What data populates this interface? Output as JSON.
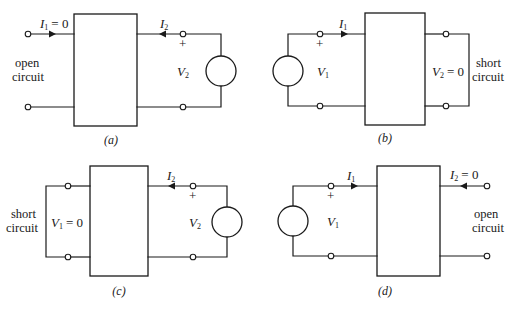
{
  "figure": {
    "panels": [
      {
        "id": "a",
        "caption": "(a)",
        "port1": {
          "current_label": "I",
          "current_sub": "1",
          "current_value": "= 0",
          "note_line1": "open",
          "note_line2": "circuit",
          "condition": "open circuit"
        },
        "port2": {
          "current_label": "I",
          "current_sub": "2",
          "voltage_label": "V",
          "voltage_sub": "2",
          "plus": "+",
          "source": "voltage source"
        }
      },
      {
        "id": "b",
        "caption": "(b)",
        "port1": {
          "current_label": "I",
          "current_sub": "1",
          "voltage_label": "V",
          "voltage_sub": "1",
          "plus": "+",
          "source": "voltage source"
        },
        "port2": {
          "voltage_label": "V",
          "voltage_sub": "2",
          "voltage_value": "= 0",
          "note_line1": "short",
          "note_line2": "circuit",
          "condition": "short circuit"
        }
      },
      {
        "id": "c",
        "caption": "(c)",
        "port1": {
          "voltage_label": "V",
          "voltage_sub": "1",
          "voltage_value": "= 0",
          "note_line1": "short",
          "note_line2": "circuit",
          "condition": "short circuit"
        },
        "port2": {
          "current_label": "I",
          "current_sub": "2",
          "voltage_label": "V",
          "voltage_sub": "2",
          "plus": "+",
          "source": "voltage source"
        }
      },
      {
        "id": "d",
        "caption": "(d)",
        "port1": {
          "current_label": "I",
          "current_sub": "1",
          "voltage_label": "V",
          "voltage_sub": "1",
          "plus": "+",
          "source": "voltage source"
        },
        "port2": {
          "current_label": "I",
          "current_sub": "2",
          "current_value": "= 0",
          "note_line1": "open",
          "note_line2": "circuit",
          "condition": "open circuit"
        }
      }
    ]
  }
}
